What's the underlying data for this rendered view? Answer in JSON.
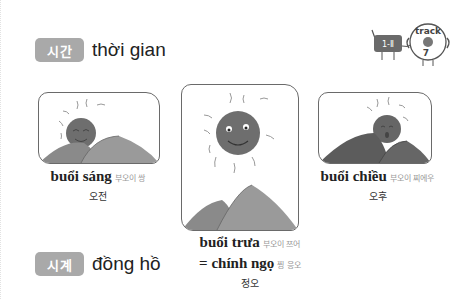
{
  "sections": [
    {
      "badge": "시간",
      "title": "thời gian"
    },
    {
      "badge": "시계",
      "title": "đồng hồ"
    }
  ],
  "track": {
    "label": "track",
    "number": "7",
    "device_label": "1-Ⅱ",
    "icon": "track-cd-icon"
  },
  "illustrations": [
    {
      "name": "morning",
      "vn": "buổi sáng",
      "pron": "부오이 쌍",
      "ko": "오전",
      "icon": "sun-rising-icon"
    },
    {
      "name": "noon",
      "vn": "buổi trưa",
      "pron": "부오이 쯔어",
      "vn2": "= chính ngọ",
      "pron2": "찡 응오",
      "ko": "정오",
      "icon": "sun-high-icon"
    },
    {
      "name": "afternoon",
      "vn": "buổi chiều",
      "pron": "부오이 찌에우",
      "ko": "오후",
      "icon": "sun-setting-icon"
    }
  ],
  "colors": {
    "badge": "#a9a9a9",
    "hill": "#8a8a8a",
    "hill_dark": "#5c5c5c",
    "sun": "#6e6e6e"
  }
}
